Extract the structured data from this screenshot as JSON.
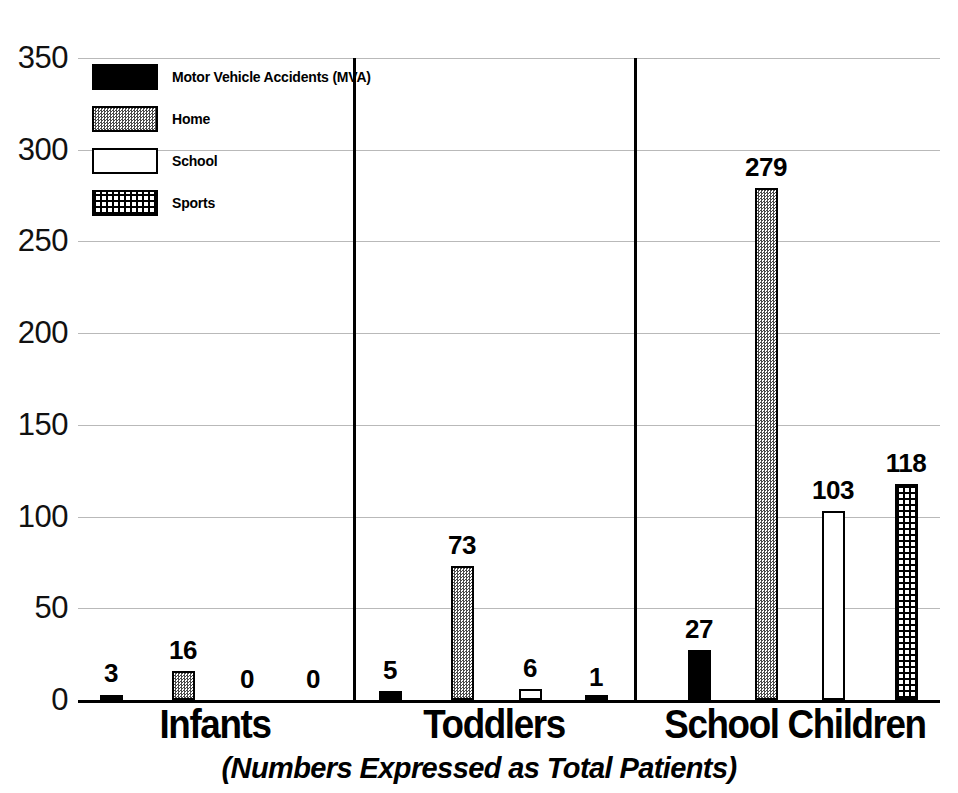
{
  "chart_data": {
    "type": "bar",
    "title": "",
    "subtitle": "(Numbers Expressed as Total Patients)",
    "xlabel": "",
    "ylabel": "",
    "ylim": [
      0,
      350
    ],
    "ytick_step": 50,
    "yticks": [
      "350",
      "300",
      "250",
      "200",
      "150",
      "100",
      "50",
      "0"
    ],
    "grid": true,
    "legend_position": "top-left",
    "categories": [
      "Infants",
      "Toddlers",
      "School Children"
    ],
    "series": [
      {
        "name": "Motor Vehicle Accidents (MVA)",
        "key": "mva",
        "color": "#000000",
        "pattern": "solid-black",
        "values": [
          3,
          5,
          27
        ]
      },
      {
        "name": "Home",
        "key": "home",
        "color": "#808080",
        "pattern": "gray-dither",
        "values": [
          16,
          73,
          279
        ]
      },
      {
        "name": "School",
        "key": "school",
        "color": "#ffffff",
        "pattern": "white-outlined",
        "values": [
          0,
          6,
          103
        ]
      },
      {
        "name": "Sports",
        "key": "sports",
        "color": "#000000",
        "pattern": "crosshatch-grid",
        "values": [
          0,
          1,
          118
        ]
      }
    ],
    "data_labels": {
      "Infants": [
        "3",
        "16",
        "0",
        "0"
      ],
      "Toddlers": [
        "5",
        "73",
        "6",
        "1"
      ],
      "School Children": [
        "27",
        "279",
        "103",
        "118"
      ]
    }
  },
  "legend": {
    "items": [
      {
        "label": "Motor Vehicle Accidents (MVA)",
        "swatch": "mva"
      },
      {
        "label": "Home",
        "swatch": "home"
      },
      {
        "label": "School",
        "swatch": "school"
      },
      {
        "label": "Sports",
        "swatch": "sports"
      }
    ]
  },
  "axis": {
    "ticks": [
      {
        "label": "350",
        "value": 350
      },
      {
        "label": "300",
        "value": 300
      },
      {
        "label": "250",
        "value": 250
      },
      {
        "label": "200",
        "value": 200
      },
      {
        "label": "150",
        "value": 150
      },
      {
        "label": "100",
        "value": 100
      },
      {
        "label": "50",
        "value": 50
      },
      {
        "label": "0",
        "value": 0
      }
    ]
  },
  "layout": {
    "plot_left": 78,
    "plot_top": 58,
    "plot_width": 862,
    "plot_height": 642,
    "bar_width": 23,
    "group_centers": [
      [
        111,
        183,
        247,
        313
      ],
      [
        390,
        462,
        530,
        596
      ],
      [
        699,
        766,
        833,
        906
      ]
    ],
    "category_centers": [
      215,
      494,
      795
    ],
    "dividers": [
      353,
      634
    ]
  }
}
